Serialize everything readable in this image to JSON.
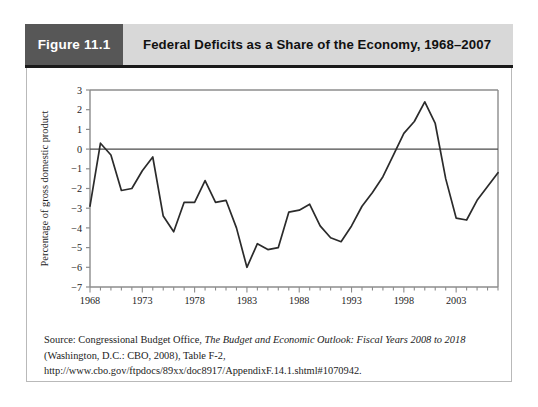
{
  "figure": {
    "tag": "Figure 11.1",
    "title": "Federal Deficits as a Share of the Economy, 1968–2007"
  },
  "source": {
    "prefix": "Source: Congressional Budget Office, ",
    "italic": "The Budget and Economic Outlook: Fiscal Years 2008 to 2018",
    "suffix": " (Washington, D.C.: CBO, 2008), Table F-2, http://www.cbo.gov/ftpdocs/89xx/doc8917/AppendixF.14.1.shtml#1070942."
  },
  "colors": {
    "tag_bg": "#575757",
    "title_bg": "#d8d8d8",
    "line": "#2b2b2b",
    "axis": "#8c8c8c",
    "zero_line": "#4a4a4a",
    "frame": "#b9b9b9"
  },
  "chart_data": {
    "type": "line",
    "title": "Federal Deficits as a Share of the Economy, 1968–2007",
    "xlabel": "",
    "ylabel": "Percentage of gross domestic product",
    "xlim": [
      1968,
      2007
    ],
    "ylim": [
      -7,
      3
    ],
    "yticks": [
      3,
      2,
      1,
      0,
      -1,
      -2,
      -3,
      -4,
      -5,
      -6,
      -7
    ],
    "ytick_labels": [
      "3",
      "2",
      "1",
      "0",
      "−1",
      "−2",
      "−3",
      "−4",
      "−5",
      "−6",
      "−7"
    ],
    "xticks": [
      1968,
      1973,
      1978,
      1983,
      1988,
      1993,
      1998,
      2003
    ],
    "xtick_labels": [
      "1968",
      "1973",
      "1978",
      "1983",
      "1988",
      "1993",
      "1998",
      "2003"
    ],
    "grid": false,
    "legend": null,
    "zero_reference_line": 0,
    "series": [
      {
        "name": "Federal surplus/deficit as % of GDP",
        "x": [
          1968,
          1969,
          1970,
          1971,
          1972,
          1973,
          1974,
          1975,
          1976,
          1977,
          1978,
          1979,
          1980,
          1981,
          1982,
          1983,
          1984,
          1985,
          1986,
          1987,
          1988,
          1989,
          1990,
          1991,
          1992,
          1993,
          1994,
          1995,
          1996,
          1997,
          1998,
          1999,
          2000,
          2001,
          2002,
          2003,
          2004,
          2005,
          2006,
          2007
        ],
        "values": [
          -2.9,
          0.3,
          -0.3,
          -2.1,
          -2.0,
          -1.1,
          -0.4,
          -3.4,
          -4.2,
          -2.7,
          -2.7,
          -1.6,
          -2.7,
          -2.6,
          -4.0,
          -6.0,
          -4.8,
          -5.1,
          -5.0,
          -3.2,
          -3.1,
          -2.8,
          -3.9,
          -4.5,
          -4.7,
          -3.9,
          -2.9,
          -2.2,
          -1.4,
          -0.3,
          0.8,
          1.4,
          2.4,
          1.3,
          -1.5,
          -3.5,
          -3.6,
          -2.6,
          -1.9,
          -1.2
        ]
      }
    ]
  }
}
